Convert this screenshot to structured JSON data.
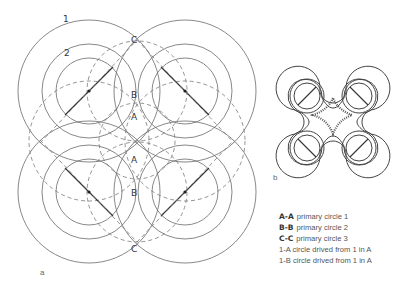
{
  "figure_a": {
    "label": "a",
    "circle_labels": {
      "outer": "1",
      "middle": "2"
    },
    "point_labels": {
      "C_top": "C",
      "B_top": "B",
      "A_top": "A",
      "A_bottom": "A",
      "B_bottom": "B",
      "C_bottom": "C"
    }
  },
  "figure_b": {
    "label": "b"
  },
  "legend": {
    "items": [
      {
        "key": "A-A",
        "text": "primary circle 1"
      },
      {
        "key": "B-B",
        "text": "primary circle 2"
      },
      {
        "key": "C-C",
        "text": "primary circle 3"
      },
      {
        "key": "",
        "text": "1-A circle drived from 1 in A"
      },
      {
        "key": "",
        "text": "1-B circle drived from 1 in A"
      }
    ]
  }
}
